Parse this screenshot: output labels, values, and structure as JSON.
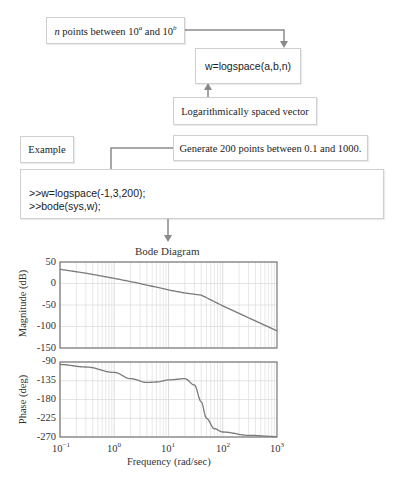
{
  "flow": {
    "box_points": {
      "italic": "n",
      "text": " points between 10",
      "sup_a": "a",
      "mid": " and 10",
      "sup_b": "b"
    },
    "box_logspace": "w=logspace(a,b,n)",
    "box_vector": "Logarithmically spaced vector",
    "box_example": "Example",
    "box_generate": "Generate 200 points between 0.1 and 1000.",
    "code": {
      "line1": ">>w=logspace(-1,3,200);",
      "line2": ">>bode(sys,w);"
    }
  },
  "colors": {
    "arrow": "#8a8a8a",
    "curve": "#7a7a7a",
    "grid": "#d9d9d9",
    "axes": "#777777",
    "box_border": "#cfcfcf"
  },
  "chart_data": {
    "type": "line",
    "title": "Bode Diagram",
    "xlabel": "Frequency (rad/sec)",
    "xscale": "log",
    "xlim": [
      0.1,
      1000
    ],
    "xticks": [
      "10^-1",
      "10^0",
      "10^1",
      "10^2",
      "10^3"
    ],
    "grid": true,
    "subplots": [
      {
        "name": "magnitude",
        "ylabel": "Magnitude (dB)",
        "ylim": [
          -150,
          50
        ],
        "yticks": [
          "50",
          "0",
          "-50",
          "-100",
          "-150"
        ],
        "x": [
          0.1,
          0.3,
          1,
          3,
          10,
          20,
          30,
          40,
          60,
          100,
          300,
          1000
        ],
        "y": [
          33,
          24,
          12,
          0,
          -15,
          -22,
          -25,
          -27,
          -38,
          -52,
          -80,
          -110
        ]
      },
      {
        "name": "phase",
        "ylabel": "Phase (deg)",
        "ylim": [
          -270,
          -90
        ],
        "yticks": [
          "-90",
          "-135",
          "-180",
          "-225",
          "-270"
        ],
        "x": [
          0.1,
          0.3,
          1,
          2,
          4,
          6,
          10,
          20,
          30,
          40,
          50,
          70,
          100,
          300,
          1000
        ],
        "y": [
          -96,
          -102,
          -115,
          -130,
          -139,
          -138,
          -133,
          -130,
          -145,
          -185,
          -225,
          -250,
          -258,
          -266,
          -269
        ]
      }
    ]
  }
}
